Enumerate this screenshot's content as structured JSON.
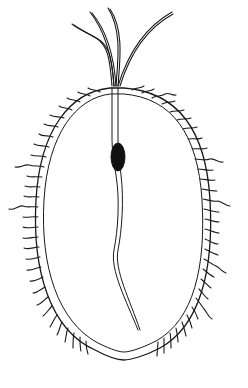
{
  "figure": {
    "style": "black-ink-line-drawing",
    "colors": {
      "background": "#ffffff",
      "ink": "#1a1a1a",
      "nucleus": "#111111"
    },
    "parts": [
      "flagella",
      "oval-cell-body",
      "marginal-fringe-projections",
      "axial-rod",
      "nucleus"
    ]
  }
}
